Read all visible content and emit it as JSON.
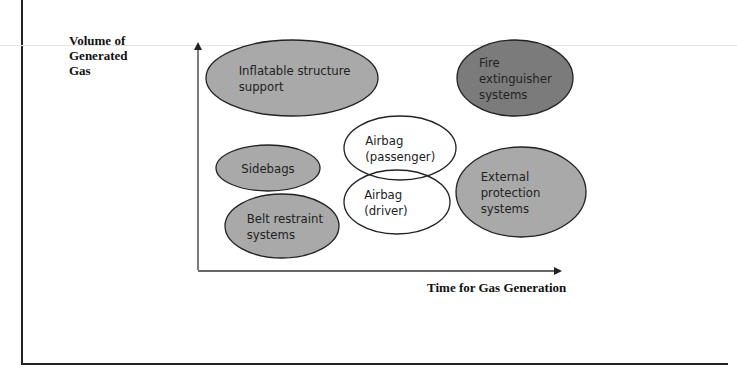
{
  "diagram": {
    "axes": {
      "y_label": "Volume of Generated Gas",
      "y_label_lines": [
        "Volume of",
        "Generated",
        "Gas"
      ],
      "x_label": "Time for Gas Generation"
    },
    "colors": {
      "light_fill": "#a9a9a9",
      "dark_fill": "#7b7b7b",
      "white_fill": "#ffffff",
      "stroke": "#222222"
    },
    "nodes": [
      {
        "id": "inflatable-structure-support",
        "lines": [
          "Inflatable structure",
          "support"
        ],
        "fill": "light",
        "cx": 292,
        "cy": 78,
        "rx": 86,
        "ry": 38
      },
      {
        "id": "fire-extinguisher-systems",
        "lines": [
          "Fire",
          "extinguisher",
          "systems"
        ],
        "fill": "dark",
        "cx": 515,
        "cy": 78,
        "rx": 58,
        "ry": 38
      },
      {
        "id": "airbag-passenger",
        "lines": [
          "Airbag",
          "(passenger)"
        ],
        "fill": "white",
        "cx": 400,
        "cy": 148,
        "rx": 56,
        "ry": 32
      },
      {
        "id": "sidebags",
        "lines": [
          "Sidebags"
        ],
        "fill": "light",
        "cx": 268,
        "cy": 168,
        "rx": 52,
        "ry": 23
      },
      {
        "id": "airbag-driver",
        "lines": [
          "Airbag",
          "(driver)"
        ],
        "fill": "white",
        "cx": 397,
        "cy": 202,
        "rx": 53,
        "ry": 32
      },
      {
        "id": "external-protection-systems",
        "lines": [
          "External",
          "protection",
          "systems"
        ],
        "fill": "light",
        "cx": 521,
        "cy": 192,
        "rx": 65,
        "ry": 45
      },
      {
        "id": "belt-restraint-systems",
        "lines": [
          "Belt restraint",
          "systems"
        ],
        "fill": "light",
        "cx": 282,
        "cy": 226,
        "rx": 57,
        "ry": 32
      }
    ]
  }
}
